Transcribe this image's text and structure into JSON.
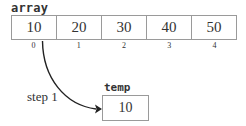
{
  "array": {
    "label": "array",
    "values": [
      "10",
      "20",
      "30",
      "40",
      "50"
    ],
    "indices": [
      "0",
      "1",
      "2",
      "3",
      "4"
    ]
  },
  "temp": {
    "label": "temp",
    "value": "10"
  },
  "arrow": {
    "label": "step 1",
    "from": "array[0]",
    "to": "temp"
  }
}
